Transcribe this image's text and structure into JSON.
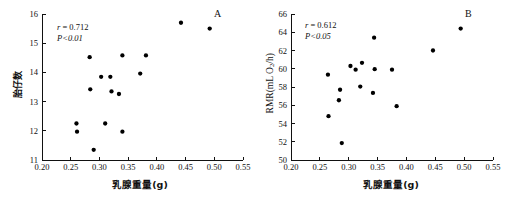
{
  "figure": {
    "background": "#ffffff",
    "point_color": "#000000",
    "axis_color": "#111111"
  },
  "panels": [
    {
      "letter": "A",
      "stats": {
        "r_prefix": "r",
        "r_value": " = 0.712",
        "p_text": "P<0.01"
      },
      "xlabel": "乳腺重量(g)",
      "ylabel": "胎仔数",
      "ylabel_is_chinese": true
    },
    {
      "letter": "B",
      "stats": {
        "r_prefix": "r",
        "r_value": " = 0.612",
        "p_text": "P<0.05"
      },
      "xlabel": "乳腺重量(g)",
      "ylabel_html": "RMR(mL O<sub>2</sub>/h)",
      "ylabel_is_chinese": false
    }
  ],
  "chart_data": [
    {
      "type": "scatter",
      "panel": "A",
      "title": "",
      "xlabel": "乳腺重量(g)",
      "ylabel": "胎仔数",
      "xlim": [
        0.2,
        0.55
      ],
      "ylim": [
        11,
        16
      ],
      "xticks": [
        0.2,
        0.25,
        0.3,
        0.35,
        0.4,
        0.45,
        0.5,
        0.55
      ],
      "xticklabels": [
        "0.20",
        "0.25",
        "0.30",
        "0.35",
        "0.40",
        "0.45",
        "0.50",
        "0.55"
      ],
      "yticks": [
        11,
        12,
        13,
        14,
        15,
        16
      ],
      "yticklabels": [
        "11",
        "12",
        "13",
        "14",
        "15",
        "16"
      ],
      "grid": false,
      "legend": false,
      "annotations": [
        "r = 0.712",
        "P<0.01"
      ],
      "correlation_r": 0.712,
      "p_value_text": "P<0.01",
      "x": [
        0.26,
        0.261,
        0.283,
        0.284,
        0.29,
        0.303,
        0.31,
        0.319,
        0.321,
        0.334,
        0.34,
        0.34,
        0.341,
        0.371,
        0.381,
        0.442,
        0.492
      ],
      "y": [
        12.25,
        11.97,
        14.52,
        13.42,
        11.35,
        13.85,
        12.25,
        13.85,
        13.35,
        13.26,
        14.58,
        11.97,
        14.58,
        13.96,
        14.58,
        15.7,
        15.5
      ],
      "points": [
        {
          "x": 0.26,
          "y": 12.25
        },
        {
          "x": 0.261,
          "y": 11.97
        },
        {
          "x": 0.283,
          "y": 14.52
        },
        {
          "x": 0.284,
          "y": 13.42
        },
        {
          "x": 0.29,
          "y": 11.35
        },
        {
          "x": 0.303,
          "y": 13.85
        },
        {
          "x": 0.31,
          "y": 12.25
        },
        {
          "x": 0.319,
          "y": 13.85
        },
        {
          "x": 0.321,
          "y": 13.35
        },
        {
          "x": 0.334,
          "y": 13.26
        },
        {
          "x": 0.34,
          "y": 14.58
        },
        {
          "x": 0.34,
          "y": 11.97
        },
        {
          "x": 0.371,
          "y": 13.96
        },
        {
          "x": 0.381,
          "y": 14.58
        },
        {
          "x": 0.442,
          "y": 15.7
        },
        {
          "x": 0.492,
          "y": 15.5
        }
      ]
    },
    {
      "type": "scatter",
      "panel": "B",
      "title": "",
      "xlabel": "乳腺重量(g)",
      "ylabel": "RMR(mL O2/h)",
      "xlim": [
        0.2,
        0.55
      ],
      "ylim": [
        50,
        66
      ],
      "xticks": [
        0.2,
        0.25,
        0.3,
        0.35,
        0.4,
        0.45,
        0.5,
        0.55
      ],
      "xticklabels": [
        "0.20",
        "0.25",
        "0.30",
        "0.35",
        "0.40",
        "0.45",
        "0.50",
        "0.55"
      ],
      "yticks": [
        50,
        52,
        54,
        56,
        58,
        60,
        62,
        64,
        66
      ],
      "yticklabels": [
        "50",
        "52",
        "54",
        "56",
        "58",
        "60",
        "62",
        "64",
        "66"
      ],
      "grid": false,
      "legend": false,
      "annotations": [
        "r = 0.612",
        "P<0.05"
      ],
      "correlation_r": 0.612,
      "p_value_text": "P<0.05",
      "x": [
        0.264,
        0.265,
        0.283,
        0.285,
        0.288,
        0.303,
        0.312,
        0.32,
        0.323,
        0.325,
        0.342,
        0.344,
        0.345,
        0.375,
        0.383,
        0.446,
        0.494
      ],
      "y": [
        59.35,
        54.8,
        56.55,
        57.7,
        51.85,
        60.3,
        59.9,
        58.05,
        60.65,
        59.95,
        57.35,
        63.4,
        59.95,
        59.9,
        55.9,
        62.0,
        64.4
      ],
      "points": [
        {
          "x": 0.264,
          "y": 59.35
        },
        {
          "x": 0.265,
          "y": 54.8
        },
        {
          "x": 0.283,
          "y": 56.55
        },
        {
          "x": 0.285,
          "y": 57.7
        },
        {
          "x": 0.288,
          "y": 51.85
        },
        {
          "x": 0.303,
          "y": 60.3
        },
        {
          "x": 0.312,
          "y": 59.9
        },
        {
          "x": 0.32,
          "y": 58.05
        },
        {
          "x": 0.323,
          "y": 60.65
        },
        {
          "x": 0.342,
          "y": 57.35
        },
        {
          "x": 0.344,
          "y": 63.4
        },
        {
          "x": 0.345,
          "y": 59.95
        },
        {
          "x": 0.375,
          "y": 59.9
        },
        {
          "x": 0.383,
          "y": 55.9
        },
        {
          "x": 0.446,
          "y": 62.0
        },
        {
          "x": 0.494,
          "y": 64.4
        }
      ]
    }
  ]
}
